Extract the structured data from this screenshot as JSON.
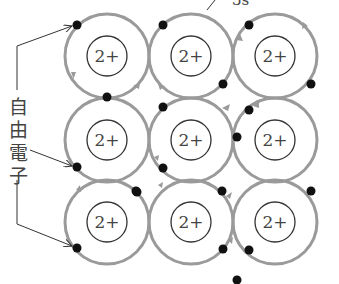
{
  "diagram": {
    "title_label": "3s",
    "free_electron_label": [
      "自",
      "由",
      "電",
      "子"
    ],
    "ion_charge": "2+",
    "colors": {
      "orbit": "#9a9a9a",
      "ion_outline": "#333333",
      "electron": "#111111",
      "text": "#444444",
      "leader": "#333333"
    },
    "grid": {
      "rows": 3,
      "cols": 3,
      "centers_x": [
        107,
        191,
        275
      ],
      "centers_y": [
        56,
        140,
        222
      ],
      "orbit_radius": 42,
      "ion_radius": 20
    },
    "ions": [
      {
        "row": 0,
        "col": 0,
        "label": "2+"
      },
      {
        "row": 0,
        "col": 1,
        "label": "2+"
      },
      {
        "row": 0,
        "col": 2,
        "label": "2+"
      },
      {
        "row": 1,
        "col": 0,
        "label": "2+"
      },
      {
        "row": 1,
        "col": 1,
        "label": "2+"
      },
      {
        "row": 1,
        "col": 2,
        "label": "2+"
      },
      {
        "row": 2,
        "col": 0,
        "label": "2+"
      },
      {
        "row": 2,
        "col": 1,
        "label": "2+"
      },
      {
        "row": 2,
        "col": 2,
        "label": "2+"
      }
    ],
    "electrons": [
      {
        "x": 77,
        "y": 25
      },
      {
        "x": 107,
        "y": 97
      },
      {
        "x": 163,
        "y": 25
      },
      {
        "x": 223,
        "y": 84
      },
      {
        "x": 249,
        "y": 25
      },
      {
        "x": 311,
        "y": 84
      },
      {
        "x": 77,
        "y": 167
      },
      {
        "x": 163,
        "y": 107
      },
      {
        "x": 163,
        "y": 168
      },
      {
        "x": 237,
        "y": 137
      },
      {
        "x": 249,
        "y": 110
      },
      {
        "x": 136,
        "y": 191
      },
      {
        "x": 222,
        "y": 191
      },
      {
        "x": 77,
        "y": 248
      },
      {
        "x": 137,
        "y": 192
      },
      {
        "x": 223,
        "y": 249
      },
      {
        "x": 249,
        "y": 250
      },
      {
        "x": 311,
        "y": 191
      },
      {
        "x": 237,
        "y": 280
      }
    ],
    "annotations": {
      "label_3s": "3s",
      "free_electron_text": "自由電子"
    }
  }
}
